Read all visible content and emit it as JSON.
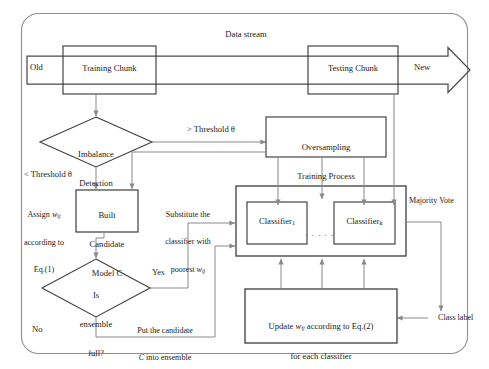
{
  "figure": {
    "stream_label": "Data stream",
    "stream_start_label": "Old",
    "stream_end_label": "New",
    "colors": {
      "line": "#8a8a8a",
      "box_border": "#3a3a3a",
      "text": "#1b1b1b",
      "background": "#ffffff",
      "outer_border": "#7a7a7a"
    }
  },
  "nodes": {
    "training_chunk": {
      "label": "Training Chunk",
      "type": "process"
    },
    "testing_chunk": {
      "label": "Testing Chunk",
      "type": "process"
    },
    "imbalance_detection": {
      "line1": "Imbalance",
      "line2": "Detection",
      "type": "decision"
    },
    "oversampling": {
      "line1": "Oversampling",
      "line2": "Training Process",
      "type": "process"
    },
    "built_candidate": {
      "line1": "Built",
      "line2": "Candidate",
      "line3": "Model C",
      "type": "process"
    },
    "ensemble_full": {
      "line1": "Is",
      "line2": "ensemble",
      "line3": "full?",
      "type": "decision"
    },
    "ensemble_box": {
      "label": "",
      "type": "container"
    },
    "classifier_1": {
      "base": "Classifier",
      "sub": "1"
    },
    "classifier_k": {
      "base": "Classifier",
      "sub": "k"
    },
    "classifier_dots": {
      "label": ". . . . ."
    },
    "update_weights": {
      "line1_a": "Update ",
      "line1_w": "w",
      "line1_sub": "ij",
      "line1_b": " according to Eq.(2)",
      "line2": "for each classifier",
      "type": "process"
    }
  },
  "edge_labels": {
    "threshold_above": "> Threshold θ",
    "threshold_below": "< Threshold θ",
    "assign_w_line1_a": "Assign ",
    "assign_w_line1_w": "w",
    "assign_w_line1_sub": "ij",
    "assign_w_line2": "according to",
    "assign_w_line3": "Eq.(1)",
    "substitute_line1": "Substitute the",
    "substitute_line2": "classifier with",
    "substitute_line3_a": "poorest ",
    "substitute_line3_w": "w",
    "substitute_line3_sub": "ij",
    "yes": "Yes",
    "no": "No",
    "put_candidate_line1": "Put the candidate",
    "put_candidate_line2_a": "C",
    "put_candidate_line2_b": " into ensemble",
    "majority_vote": "Majority Vote",
    "class_label": "Class label"
  }
}
